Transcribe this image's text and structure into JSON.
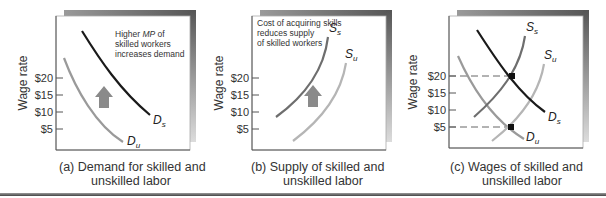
{
  "figure": {
    "panels": [
      {
        "id": "a",
        "annotation": [
          "Higher MP of",
          "skilled workers",
          "increases demand"
        ],
        "annotation_italic_word": "MP",
        "y_axis_label": "Wage rate",
        "y_ticks": [
          "$20",
          "$15",
          "$10",
          "$5"
        ],
        "curves": [
          {
            "label": "D",
            "subscript": "s",
            "name": "Demand for skilled labor",
            "color": "#1a1a1a"
          },
          {
            "label": "D",
            "subscript": "u",
            "name": "Demand for unskilled labor",
            "color": "#9a9a9a"
          }
        ],
        "arrow": "up",
        "caption": [
          "(a) Demand for skilled and",
          "unskilled labor"
        ]
      },
      {
        "id": "b",
        "annotation": [
          "Cost of acquiring skills",
          "reduces supply",
          "of skilled workers"
        ],
        "y_axis_label": "Wage rate",
        "y_ticks": [
          "$20",
          "$15",
          "$10",
          "$5"
        ],
        "curves": [
          {
            "label": "S",
            "subscript": "s",
            "name": "Supply of skilled labor",
            "color": "#6e6e6e"
          },
          {
            "label": "S",
            "subscript": "u",
            "name": "Supply of unskilled labor",
            "color": "#b5b5b5"
          }
        ],
        "arrow": "up",
        "caption": [
          "(b) Supply of skilled and",
          "unskilled labor"
        ]
      },
      {
        "id": "c",
        "y_axis_label": "Wage rate",
        "y_ticks": [
          "$20",
          "$15",
          "$10",
          "$5"
        ],
        "curves": [
          {
            "label": "S",
            "subscript": "s",
            "name": "Supply of skilled labor",
            "color": "#6e6e6e"
          },
          {
            "label": "S",
            "subscript": "u",
            "name": "Supply of unskilled labor",
            "color": "#b5b5b5"
          },
          {
            "label": "D",
            "subscript": "s",
            "name": "Demand for skilled labor",
            "color": "#1a1a1a"
          },
          {
            "label": "D",
            "subscript": "u",
            "name": "Demand for unskilled labor",
            "color": "#9a9a9a"
          }
        ],
        "equilibria": [
          {
            "market": "skilled",
            "wage": "$20"
          },
          {
            "market": "unskilled",
            "wage": "$5"
          }
        ],
        "caption": [
          "(c) Wages of skilled and",
          "unskilled labor"
        ]
      }
    ],
    "colors": {
      "frame_shadow": "#6f6f6f",
      "axis": "#555555",
      "arrow": "#8a8a8a"
    }
  }
}
